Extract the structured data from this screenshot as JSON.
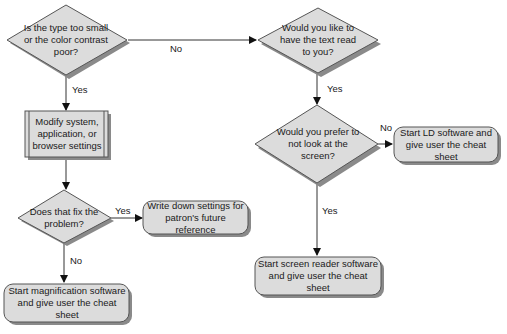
{
  "colors": {
    "fill": "#dcdcdc",
    "stroke": "#555555",
    "shadow": "#8a8a8a",
    "line": "#333333",
    "text": "#1a1a1a"
  },
  "nodes": {
    "q_type_small": {
      "shape": "decision",
      "text": "Is the type too small or the color contrast poor?"
    },
    "modify_settings": {
      "shape": "predefined-process",
      "text": "Modify system, application, or browser settings"
    },
    "q_fix_problem": {
      "shape": "decision",
      "text": "Does that fix the problem?"
    },
    "write_down": {
      "shape": "terminal",
      "text": "Write down settings for patron's future reference"
    },
    "start_magnification": {
      "shape": "terminal",
      "text": "Start magnification software and give user the cheat sheet"
    },
    "q_read_to_you": {
      "shape": "decision",
      "text": "Would you like to have the text read to you?"
    },
    "q_not_look": {
      "shape": "decision",
      "text": "Would you prefer to not look at the screen?"
    },
    "start_ld": {
      "shape": "terminal",
      "text": "Start LD software and give user the cheat sheet"
    },
    "start_screen_reader": {
      "shape": "terminal",
      "text": "Start screen reader software and give user the cheat sheet"
    }
  },
  "edges": {
    "e1": {
      "from": "q_type_small",
      "to": "q_read_to_you",
      "label": "No"
    },
    "e2": {
      "from": "q_type_small",
      "to": "modify_settings",
      "label": "Yes"
    },
    "e3": {
      "from": "modify_settings",
      "to": "q_fix_problem",
      "label": ""
    },
    "e4": {
      "from": "q_fix_problem",
      "to": "write_down",
      "label": "Yes"
    },
    "e5": {
      "from": "q_fix_problem",
      "to": "start_magnification",
      "label": "No"
    },
    "e6": {
      "from": "q_read_to_you",
      "to": "q_not_look",
      "label": "Yes"
    },
    "e7": {
      "from": "q_not_look",
      "to": "start_ld",
      "label": "No"
    },
    "e8": {
      "from": "q_not_look",
      "to": "start_screen_reader",
      "label": "Yes"
    }
  }
}
